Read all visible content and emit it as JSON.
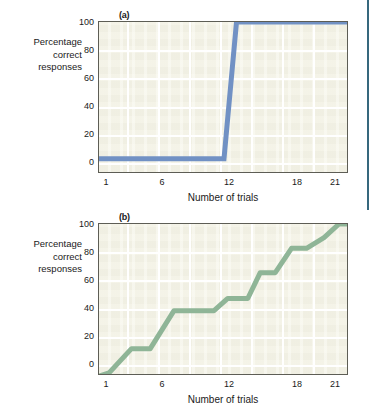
{
  "figure": {
    "background": "#ffffff",
    "edge_rule_color": "#36687d"
  },
  "panels": [
    {
      "letter": "(a)",
      "ylabel_lines": [
        "Percentage",
        "correct",
        "responses"
      ],
      "xlabel": "Number of trials",
      "line_color": "#7191c4",
      "plot_bg": "#f3f2e6",
      "grid_color": "#ffffff",
      "yticks": [
        "0",
        "20",
        "40",
        "60",
        "80",
        "100"
      ],
      "xticks": [
        "1",
        "6",
        "12",
        "18",
        "21"
      ]
    },
    {
      "letter": "(b)",
      "ylabel_lines": [
        "Percentage",
        "correct",
        "responses"
      ],
      "xlabel": "Number of trials",
      "line_color": "#8fb597",
      "plot_bg": "#f3f2e6",
      "grid_color": "#ffffff",
      "yticks": [
        "0",
        "20",
        "40",
        "60",
        "80",
        "100"
      ],
      "xticks": [
        "1",
        "6",
        "12",
        "18",
        "21"
      ]
    }
  ],
  "chart_data": [
    {
      "type": "line",
      "panel": "(a)",
      "title": "(a)",
      "xlabel": "Number of trials",
      "ylabel": "Percentage correct responses",
      "xlim": [
        1,
        21
      ],
      "ylim": [
        0,
        100
      ],
      "ytick_values": [
        0,
        20,
        40,
        60,
        80,
        100
      ],
      "xtick_values": [
        1,
        6,
        12,
        18,
        21
      ],
      "grid": true,
      "legend": "none",
      "series": [
        {
          "name": "insight learning",
          "color": "#7191c4",
          "x": [
            1,
            11,
            12,
            21
          ],
          "y": [
            10,
            10,
            100,
            100
          ]
        }
      ]
    },
    {
      "type": "line",
      "panel": "(b)",
      "title": "(b)",
      "xlabel": "Number of trials",
      "ylabel": "Percentage correct responses",
      "xlim": [
        1,
        21
      ],
      "ylim": [
        0,
        100
      ],
      "ytick_values": [
        0,
        20,
        40,
        60,
        80,
        100
      ],
      "xtick_values": [
        1,
        6,
        12,
        18,
        21
      ],
      "grid": true,
      "legend": "none",
      "series": [
        {
          "name": "gradual learning",
          "color": "#8fb597",
          "x": [
            1,
            1.8,
            3.6,
            5.1,
            7.0,
            8.4,
            10.2,
            11.3,
            12.9,
            13.9,
            15.1,
            16.4,
            17.6,
            19.0,
            20.2,
            21
          ],
          "y": [
            0,
            2,
            18,
            18,
            43,
            43,
            43,
            51,
            51,
            68,
            68,
            84,
            84,
            91,
            100,
            100
          ]
        }
      ]
    }
  ]
}
